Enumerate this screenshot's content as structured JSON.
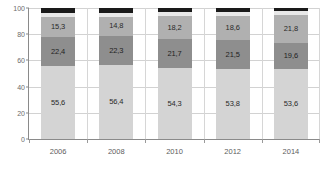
{
  "chart_data": {
    "type": "bar",
    "stacked": true,
    "title": "",
    "subtitle": "",
    "xlabel": "",
    "ylabel": "",
    "categories": [
      "2006",
      "2008",
      "2010",
      "2012",
      "2014"
    ],
    "ylim": [
      0,
      100
    ],
    "yticks": [
      0,
      20,
      40,
      60,
      80,
      100
    ],
    "ytick_labels": [
      "0",
      "20",
      "40",
      "60",
      "80",
      "100"
    ],
    "grid": true,
    "grid_axis": "both",
    "legend": "none",
    "value_decimal_separator": ",",
    "series": [
      {
        "name": "series-1",
        "color": "#d4d4d4",
        "values": [
          55.6,
          56.4,
          54.3,
          53.8,
          53.6
        ],
        "labels": [
          "55,6",
          "56,4",
          "54,3",
          "53,8",
          "53,6"
        ]
      },
      {
        "name": "series-2",
        "color": "#8e8e8e",
        "values": [
          22.4,
          22.3,
          21.7,
          21.5,
          19.6
        ],
        "labels": [
          "22,4",
          "22,3",
          "21,7",
          "21,5",
          "19,6"
        ]
      },
      {
        "name": "series-3",
        "color": "#b0b0b0",
        "values": [
          15.3,
          14.8,
          18.2,
          18.6,
          21.8
        ],
        "labels": [
          "15,3",
          "14,8",
          "18,2",
          "18,6",
          "21,8"
        ]
      },
      {
        "name": "series-4",
        "color": "#e8e8e8",
        "values": [
          3.2,
          3.0,
          2.8,
          3.0,
          2.5
        ],
        "labels": [
          "",
          "",
          "",
          "",
          ""
        ]
      },
      {
        "name": "series-5",
        "color": "#1a1a1a",
        "values": [
          3.5,
          3.5,
          3.0,
          3.1,
          2.5
        ],
        "labels": [
          "",
          "",
          "",
          "",
          ""
        ]
      }
    ]
  }
}
